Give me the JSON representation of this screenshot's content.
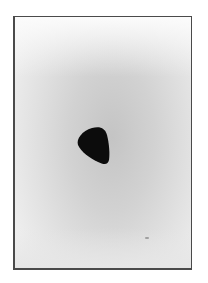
{
  "image": {
    "description": "Scanned grayscale photograph with a thin dark border showing a hazy gray sky with a dark rounded-triangular object near the center",
    "caption": "",
    "colors": {
      "frame_border": "#4a4a4a",
      "sky_center": "#c4c4c4",
      "sky_edge": "#f4f4f4",
      "object": "#0c0c0c"
    }
  }
}
